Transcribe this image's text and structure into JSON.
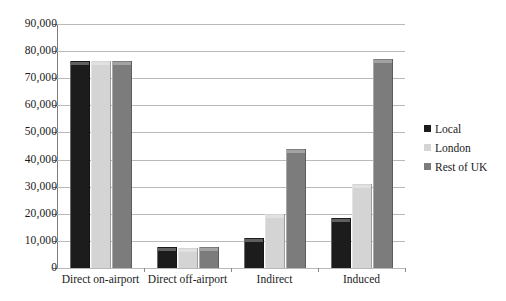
{
  "chart_data": {
    "type": "bar",
    "title": "",
    "subtitle": "",
    "xlabel": "",
    "ylabel": "",
    "categories": [
      "Direct on-airport",
      "Direct off-airport",
      "Indirect",
      "Induced"
    ],
    "series": [
      {
        "name": "Local",
        "color": "#1c1c1c",
        "values": [
          76500,
          7600,
          11000,
          18500
        ]
      },
      {
        "name": "London",
        "color": "#d4d4d4",
        "values": [
          76500,
          7500,
          20000,
          31000
        ]
      },
      {
        "name": "Rest of UK",
        "color": "#7c7c7c",
        "values": [
          76500,
          7700,
          44000,
          77000
        ]
      }
    ],
    "ylim": [
      0,
      90000
    ],
    "ytick_values": [
      0,
      10000,
      20000,
      30000,
      40000,
      50000,
      60000,
      70000,
      80000,
      90000
    ],
    "ytick_labels": [
      "0",
      "10,000",
      "20,000",
      "30,000",
      "40,000",
      "50,000",
      "60,000",
      "70,000",
      "80,000",
      "90,000"
    ],
    "grid": true,
    "grid_axis": "y",
    "legend_position": "right",
    "legend_entries": [
      "Local",
      "London",
      "Rest of UK"
    ],
    "background_color": "#ffffff",
    "gridline_color": "#b9b9b9",
    "axis_color": "#8a8a8a"
  }
}
